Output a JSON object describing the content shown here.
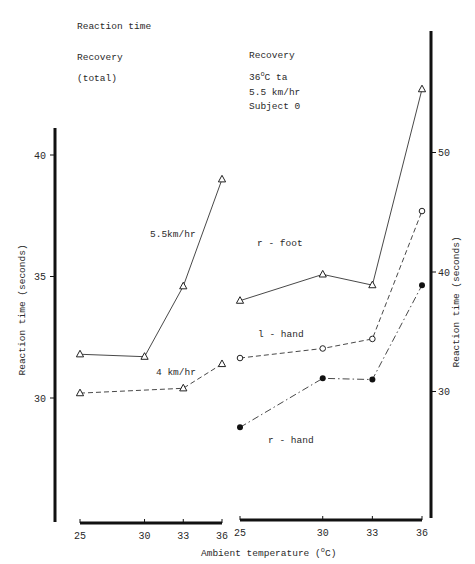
{
  "left_panel": {
    "title": "Reaction time",
    "subtitle1": "Recovery",
    "subtitle2": "(total)"
  },
  "right_panel": {
    "title": "Recovery",
    "cond1": "36",
    "cond1_sup": "o",
    "cond1_rest": "C ta",
    "cond2": "5.5 km/hr",
    "cond3": "Subject 0"
  },
  "shared": {
    "xlabel_pre": "Ambient temperature (",
    "xlabel_sup": "o",
    "xlabel_post": "C)",
    "ylabel": "Reaction time (seconds)"
  },
  "chart_data": [
    {
      "type": "line",
      "title": "Reaction time Recovery (total)",
      "xlabel": "Ambient temperature (°C)",
      "ylabel": "Reaction time (seconds)",
      "x": [
        25,
        30,
        33,
        36
      ],
      "xticks": [
        "25",
        "30",
        "33",
        "36"
      ],
      "yticks": [
        "30",
        "35",
        "40"
      ],
      "ylim": [
        25,
        41.5
      ],
      "grid": false,
      "legend": "inline labels",
      "series": [
        {
          "name": "5.5km/hr",
          "marker": "open-triangle",
          "line": "solid",
          "x": [
            25,
            30,
            33,
            36
          ],
          "values": [
            31.8,
            31.7,
            34.6,
            39.0
          ]
        },
        {
          "name": "4 km/hr",
          "marker": "open-triangle",
          "line": "dashed",
          "x": [
            25,
            33,
            36
          ],
          "values": [
            30.2,
            30.4,
            31.4
          ]
        }
      ]
    },
    {
      "type": "line",
      "title": "Recovery 36°C ta 5.5 km/hr Subject 0",
      "xlabel": "Ambient temperature (°C)",
      "ylabel": "Reaction time (seconds)",
      "x": [
        25,
        30,
        33,
        36
      ],
      "xticks": [
        "25",
        "30",
        "33",
        "36"
      ],
      "yticks": [
        "30",
        "40",
        "50"
      ],
      "ylim": [
        20,
        58
      ],
      "grid": false,
      "legend": "inline labels",
      "series": [
        {
          "name": "r - foot",
          "marker": "open-triangle",
          "line": "solid",
          "x": [
            25,
            30,
            33,
            36
          ],
          "values": [
            37.6,
            39.8,
            38.9,
            55.3
          ]
        },
        {
          "name": "l - hand",
          "marker": "open-circle",
          "line": "dashed",
          "x": [
            25,
            30,
            33,
            36
          ],
          "values": [
            32.8,
            33.6,
            34.4,
            45.1
          ]
        },
        {
          "name": "r - hand",
          "marker": "filled-circle",
          "line": "dash-dot",
          "x": [
            25,
            30,
            33,
            36
          ],
          "values": [
            27.0,
            31.1,
            31.0,
            38.9
          ]
        }
      ]
    }
  ]
}
